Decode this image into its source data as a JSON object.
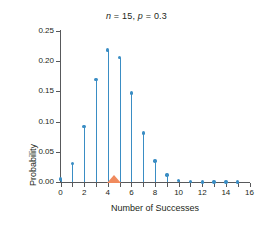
{
  "chart_data": {
    "type": "scatter",
    "title": "n = 15, p = 0.3",
    "title_parts": {
      "n_symbol": "n",
      "n_text": " = 15, ",
      "p_symbol": "p",
      "p_text": " = 0.3"
    },
    "xlabel": "Number of Successes",
    "ylabel": "Probability",
    "x": [
      0,
      1,
      2,
      3,
      4,
      5,
      6,
      7,
      8,
      9,
      10,
      11,
      12,
      13,
      14,
      15
    ],
    "values": [
      0.0047,
      0.0305,
      0.0916,
      0.17,
      0.2186,
      0.2061,
      0.1472,
      0.0811,
      0.0348,
      0.0116,
      0.003,
      0.0006,
      0.0001,
      0.0,
      0.0,
      0.0
    ],
    "xlim": [
      0,
      16
    ],
    "ylim": [
      0.0,
      0.25
    ],
    "xticks": [
      0,
      1,
      2,
      3,
      4,
      5,
      6,
      7,
      8,
      9,
      10,
      11,
      12,
      13,
      14,
      15,
      16
    ],
    "xtick_labels": [
      "0",
      "",
      "2",
      "",
      "4",
      "",
      "6",
      "",
      "8",
      "",
      "10",
      "",
      "12",
      "",
      "14",
      "",
      "16"
    ],
    "yticks": [
      0.0,
      0.05,
      0.1,
      0.15,
      0.2,
      0.25
    ],
    "ytick_labels": [
      "0.00",
      "0.05",
      "0.10",
      "0.15",
      "0.20",
      "0.25"
    ],
    "grid": false,
    "legend": "none",
    "marker_color": "#3a8dc4",
    "stem_color": "#3a8dc4",
    "axis_color": "#58595b",
    "annotation": {
      "name": "mean-marker",
      "shape": "triangle",
      "x": 4.5,
      "color": "#f08a5d"
    }
  }
}
